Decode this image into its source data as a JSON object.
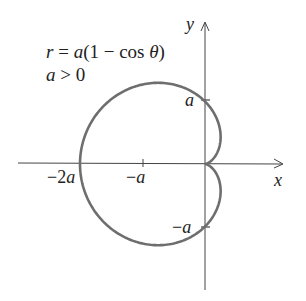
{
  "chart_data": {
    "type": "line",
    "equation": "r = a(1 − cos θ)",
    "condition": "a > 0",
    "xlabel": "x",
    "ylabel": "y",
    "x_ticks": [
      "−2a",
      "−a"
    ],
    "y_ticks": [
      "a",
      "−a"
    ],
    "key_points": [
      {
        "label": "−2a",
        "x": -2,
        "y": 0
      },
      {
        "label": "−a",
        "x": -1,
        "y": 0
      },
      {
        "label": "a",
        "x": 0,
        "y": 1
      },
      {
        "label": "−a",
        "x": 0,
        "y": -1
      },
      {
        "label": "origin (cusp)",
        "x": 0,
        "y": 0
      }
    ],
    "grid": false
  },
  "labels": {
    "eq_line1": "r = a(1 − cos θ)",
    "eq_line2": "a > 0",
    "x_axis": "x",
    "y_axis": "y",
    "tick_neg2a": "−2a",
    "tick_nega_x": "−a",
    "tick_a_y": "a",
    "tick_nega_y": "−a"
  },
  "colors": {
    "curve": "#6e6e6e",
    "axes": "#444444",
    "text": "#222222"
  }
}
